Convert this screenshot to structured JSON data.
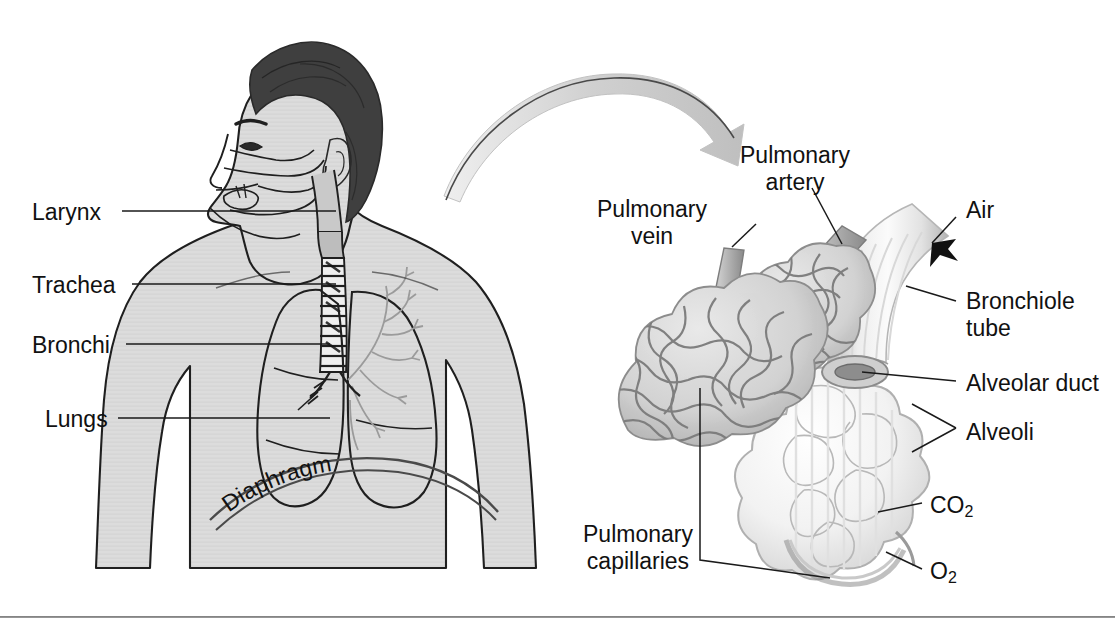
{
  "figure": {
    "width": 1115,
    "height": 625,
    "background": "#ffffff",
    "line_color": "#1a1a1a",
    "body_fill": "#d9d9d9",
    "hair_fill": "#3f3f3f",
    "arrow_fill": "#d4d4d4",
    "text_color": "#111111"
  },
  "left_panel": {
    "name": "torso-anatomy",
    "labels": [
      {
        "id": "larynx",
        "text": "Larynx",
        "x": 32,
        "y": 199
      },
      {
        "id": "trachea",
        "text": "Trachea",
        "x": 32,
        "y": 272
      },
      {
        "id": "bronchi",
        "text": "Bronchi",
        "x": 32,
        "y": 332
      },
      {
        "id": "lungs",
        "text": "Lungs",
        "x": 45,
        "y": 406
      }
    ],
    "curved_label": {
      "id": "diaphragm",
      "text": "Diaphragm"
    }
  },
  "right_panel": {
    "name": "alveoli-detail",
    "labels": [
      {
        "id": "pulmonary-vein",
        "text": "Pulmonary\nvein",
        "x": 652,
        "y": 196,
        "align": "center"
      },
      {
        "id": "pulmonary-artery",
        "text": "Pulmonary\nartery",
        "x": 795,
        "y": 142,
        "align": "center"
      },
      {
        "id": "air",
        "text": "Air",
        "x": 966,
        "y": 197,
        "align": "left"
      },
      {
        "id": "bronchiole-tube",
        "text": "Bronchiole\ntube",
        "x": 966,
        "y": 288,
        "align": "left"
      },
      {
        "id": "alveolar-duct",
        "text": "Alveolar duct",
        "x": 966,
        "y": 370,
        "align": "left"
      },
      {
        "id": "alveoli",
        "text": "Alveoli",
        "x": 966,
        "y": 419,
        "align": "left"
      },
      {
        "id": "carbon-dioxide",
        "text": "CO",
        "sub": "2",
        "x": 930,
        "y": 492,
        "align": "left"
      },
      {
        "id": "oxygen",
        "text": "O",
        "sub": "2",
        "x": 930,
        "y": 558,
        "align": "left"
      },
      {
        "id": "pulmonary-capillaries",
        "text": "Pulmonary\ncapillaries",
        "x": 638,
        "y": 521,
        "align": "center"
      }
    ]
  },
  "annotations": {
    "transition_arrow": "curved-arrow-pointing-to-alveoli-detail",
    "bottom_rule": "horizontal-divider"
  }
}
